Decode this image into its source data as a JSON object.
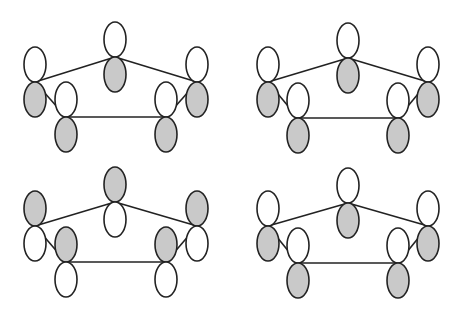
{
  "figure": {
    "colors": {
      "shaded": "#c9c9c9",
      "unshaded": "#ffffff",
      "outline": "#222222",
      "background": "#ffffff"
    },
    "lobe_size": {
      "rx": 11,
      "ry": 17.5
    },
    "panels": [
      {
        "id": "top-left",
        "atoms": [
          {
            "name": "center",
            "x": 115,
            "y": 57,
            "shaded": "bottom"
          },
          {
            "name": "left-outer",
            "x": 35,
            "y": 82,
            "shaded": "bottom"
          },
          {
            "name": "left-inner",
            "x": 66,
            "y": 117,
            "shaded": "bottom"
          },
          {
            "name": "right-inner",
            "x": 166,
            "y": 117,
            "shaded": "bottom"
          },
          {
            "name": "right-outer",
            "x": 197,
            "y": 82,
            "shaded": "bottom"
          }
        ]
      },
      {
        "id": "top-right",
        "atoms": [
          {
            "name": "center",
            "x": 348,
            "y": 58,
            "shaded": "bottom"
          },
          {
            "name": "left-outer",
            "x": 268,
            "y": 82,
            "shaded": "bottom"
          },
          {
            "name": "left-inner",
            "x": 298,
            "y": 118,
            "shaded": "bottom"
          },
          {
            "name": "right-inner",
            "x": 398,
            "y": 118,
            "shaded": "bottom"
          },
          {
            "name": "right-outer",
            "x": 428,
            "y": 82,
            "shaded": "bottom"
          }
        ]
      },
      {
        "id": "bottom-left",
        "atoms": [
          {
            "name": "center",
            "x": 115,
            "y": 202,
            "shaded": "top"
          },
          {
            "name": "left-outer",
            "x": 35,
            "y": 226,
            "shaded": "top"
          },
          {
            "name": "left-inner",
            "x": 66,
            "y": 262,
            "shaded": "top"
          },
          {
            "name": "right-inner",
            "x": 166,
            "y": 262,
            "shaded": "top"
          },
          {
            "name": "right-outer",
            "x": 197,
            "y": 226,
            "shaded": "top"
          }
        ]
      },
      {
        "id": "bottom-right",
        "atoms": [
          {
            "name": "center",
            "x": 348,
            "y": 203,
            "shaded": "bottom"
          },
          {
            "name": "left-outer",
            "x": 268,
            "y": 226,
            "shaded": "bottom"
          },
          {
            "name": "left-inner",
            "x": 298,
            "y": 263,
            "shaded": "bottom"
          },
          {
            "name": "right-inner",
            "x": 398,
            "y": 263,
            "shaded": "bottom"
          },
          {
            "name": "right-outer",
            "x": 428,
            "y": 226,
            "shaded": "bottom"
          }
        ]
      }
    ],
    "bonds": [
      [
        "center",
        "left-outer"
      ],
      [
        "left-outer",
        "left-inner"
      ],
      [
        "left-inner",
        "right-inner"
      ],
      [
        "right-inner",
        "right-outer"
      ],
      [
        "right-outer",
        "center"
      ]
    ]
  }
}
